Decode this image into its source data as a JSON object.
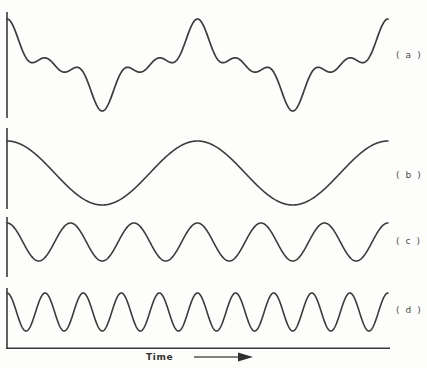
{
  "figure": {
    "title": "",
    "background_color": "#fdfdfc",
    "line_color": "#3c3c3c",
    "axis_color": "#3a3a3a"
  },
  "axis": {
    "x_label": "Time",
    "x_arrow_icon": "arrow-right-icon"
  },
  "traces": [
    {
      "id": "a",
      "label": "( a )",
      "kind": "composite",
      "baseline_y": 65,
      "amplitude_px": 46
    },
    {
      "id": "b",
      "label": "( b )",
      "kind": "sine",
      "baseline_y": 173,
      "amplitude_px": 32,
      "cycles": 2.0,
      "phase_deg": 90
    },
    {
      "id": "c",
      "label": "( c )",
      "kind": "sine",
      "baseline_y": 242,
      "amplitude_px": 19,
      "cycles": 6.0,
      "phase_deg": 90
    },
    {
      "id": "d",
      "label": "( d )",
      "kind": "sine",
      "baseline_y": 312,
      "amplitude_px": 19,
      "cycles": 10.0,
      "phase_deg": 90
    }
  ],
  "chart_data": {
    "type": "line",
    "title": "",
    "subtitle": "",
    "xlabel": "Time",
    "ylabel": "",
    "grid": false,
    "legend_position": "right",
    "x": [
      0,
      0.05,
      0.1,
      0.15,
      0.2,
      0.25,
      0.3,
      0.35,
      0.4,
      0.45,
      0.5,
      0.55,
      0.6,
      0.65,
      0.7,
      0.75,
      0.8,
      0.85,
      0.9,
      0.95,
      1.0
    ],
    "axis_ranges": {
      "x": [
        0,
        1
      ],
      "y": [
        -1,
        1
      ]
    },
    "annotations": [
      "( a )",
      "( b )",
      "( c )",
      "( d )"
    ],
    "series": [
      {
        "name": "( a )",
        "description": "composite waveform, sum of (b) + (c) + (d)",
        "cycles": 2,
        "amplitude": 1.0,
        "values": [
          0.45,
          1.0,
          0.36,
          -0.12,
          -0.1,
          -0.55,
          -0.24,
          -1.0,
          -0.3,
          -0.06,
          0.12,
          0.55,
          0.22,
          0.9,
          0.2,
          -0.2,
          -0.2,
          -0.62,
          -0.3,
          -0.95,
          -0.2
        ]
      },
      {
        "name": "( b )",
        "description": "fundamental sine, lowest frequency",
        "cycles": 2,
        "amplitude": 0.62,
        "values": [
          0.62,
          0.5,
          0.19,
          -0.19,
          -0.5,
          -0.62,
          -0.5,
          -0.19,
          0.19,
          0.5,
          0.62,
          0.5,
          0.19,
          -0.19,
          -0.5,
          -0.62,
          -0.5,
          -0.19,
          0.19,
          0.5,
          0.62
        ]
      },
      {
        "name": "( c )",
        "description": "third-harmonic sine",
        "cycles": 6,
        "amplitude": 0.38,
        "values": [
          0.38,
          -0.12,
          -0.31,
          0.31,
          0.12,
          -0.38,
          0.12,
          0.31,
          -0.31,
          -0.12,
          0.38,
          -0.12,
          -0.31,
          0.31,
          0.12,
          -0.38,
          0.12,
          0.31,
          -0.31,
          -0.12,
          0.38
        ]
      },
      {
        "name": "( d )",
        "description": "fifth-harmonic sine, highest frequency",
        "cycles": 10,
        "amplitude": 0.38,
        "values": [
          0.38,
          -0.38,
          0.38,
          -0.38,
          0.38,
          -0.38,
          0.38,
          -0.38,
          0.38,
          -0.38,
          0.38,
          -0.38,
          0.38,
          -0.38,
          0.38,
          -0.38,
          0.38,
          -0.38,
          0.38,
          -0.38,
          0.38
        ]
      }
    ]
  }
}
